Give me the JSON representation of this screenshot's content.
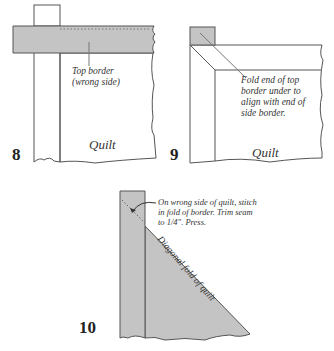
{
  "panels": [
    {
      "number": "8",
      "labels": {
        "callout": [
          "Top border",
          "(wrong side)"
        ],
        "quilt": "Quilt"
      }
    },
    {
      "number": "9",
      "labels": {
        "callout": [
          "Fold end of top",
          "border under to",
          "align with end of",
          "side border."
        ],
        "quilt": "Quilt"
      }
    },
    {
      "number": "10",
      "labels": {
        "callout": [
          "On wrong side of quilt, stitch",
          "in fold of border. Trim seam",
          "to 1/4\". Press."
        ],
        "diagonal": "Diagonal fold of quilt"
      }
    }
  ],
  "colors": {
    "fabric": "#c4c4c4",
    "outline": "#555555",
    "background": "#ffffff"
  }
}
